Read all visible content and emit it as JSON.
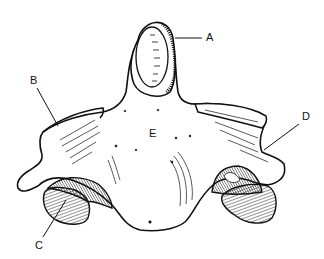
{
  "figure": {
    "stroke_color": "#111111",
    "background": "#ffffff",
    "labels": [
      {
        "id": "A",
        "text": "A",
        "x": 206,
        "y": 32
      },
      {
        "id": "B",
        "text": "B",
        "x": 30,
        "y": 75
      },
      {
        "id": "C",
        "text": "C",
        "x": 35,
        "y": 240
      },
      {
        "id": "D",
        "text": "D",
        "x": 302,
        "y": 111
      },
      {
        "id": "E",
        "text": "E",
        "x": 149,
        "y": 128
      }
    ]
  }
}
